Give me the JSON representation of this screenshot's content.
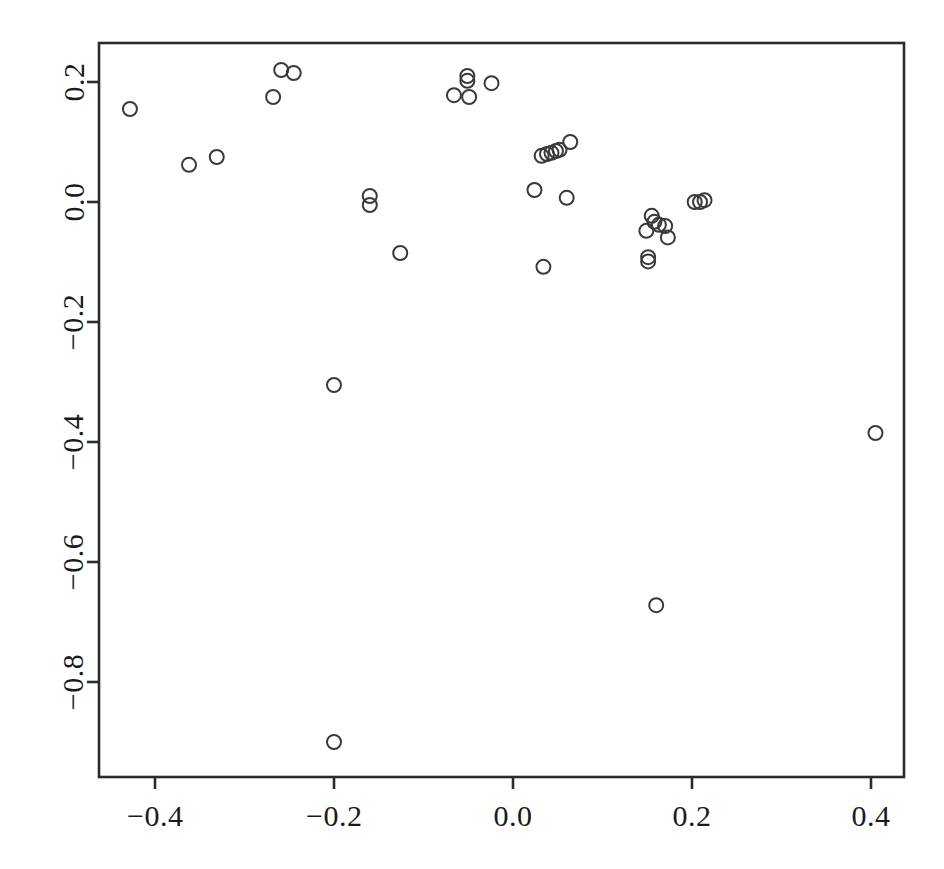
{
  "chart_data": {
    "type": "scatter",
    "title": "",
    "subtitle": "",
    "xlabel": "",
    "ylabel": "",
    "xlim": [
      -0.462,
      0.437
    ],
    "ylim": [
      -0.958,
      0.265
    ],
    "grid": false,
    "legend": null,
    "marker": {
      "shape": "circle-open",
      "radius_px": 7,
      "stroke": "#3a3a3a",
      "stroke_width_px": 2,
      "fill": "none"
    },
    "axes": {
      "x_ticks": [
        -0.4,
        -0.2,
        0.0,
        0.2,
        0.4
      ],
      "x_tick_labels": [
        "-0.4",
        "-0.2",
        "0.0",
        "0.2",
        "0.4"
      ],
      "y_ticks": [
        0.2,
        0.0,
        -0.2,
        -0.4,
        -0.6,
        -0.8
      ],
      "y_tick_labels": [
        "0.2",
        "0.0",
        "-0.2",
        "-0.4",
        "-0.6",
        "-0.8"
      ],
      "box": true,
      "tick_direction": "out"
    },
    "n_points": 37,
    "points": [
      {
        "x": -0.428,
        "y": 0.155
      },
      {
        "x": -0.362,
        "y": 0.062
      },
      {
        "x": -0.331,
        "y": 0.075
      },
      {
        "x": -0.268,
        "y": 0.175
      },
      {
        "x": -0.259,
        "y": 0.22
      },
      {
        "x": -0.245,
        "y": 0.215
      },
      {
        "x": -0.2,
        "y": -0.305
      },
      {
        "x": -0.2,
        "y": -0.9
      },
      {
        "x": -0.16,
        "y": 0.01
      },
      {
        "x": -0.16,
        "y": -0.005
      },
      {
        "x": -0.126,
        "y": -0.085
      },
      {
        "x": -0.066,
        "y": 0.178
      },
      {
        "x": -0.051,
        "y": 0.21
      },
      {
        "x": -0.051,
        "y": 0.202
      },
      {
        "x": -0.049,
        "y": 0.175
      },
      {
        "x": -0.024,
        "y": 0.198
      },
      {
        "x": 0.024,
        "y": 0.02
      },
      {
        "x": 0.032,
        "y": 0.077
      },
      {
        "x": 0.034,
        "y": -0.108
      },
      {
        "x": 0.038,
        "y": 0.08
      },
      {
        "x": 0.043,
        "y": 0.082
      },
      {
        "x": 0.048,
        "y": 0.085
      },
      {
        "x": 0.052,
        "y": 0.087
      },
      {
        "x": 0.06,
        "y": 0.007
      },
      {
        "x": 0.064,
        "y": 0.1
      },
      {
        "x": 0.149,
        "y": -0.048
      },
      {
        "x": 0.151,
        "y": -0.092
      },
      {
        "x": 0.151,
        "y": -0.099
      },
      {
        "x": 0.155,
        "y": -0.023
      },
      {
        "x": 0.158,
        "y": -0.033
      },
      {
        "x": 0.16,
        "y": -0.672
      },
      {
        "x": 0.163,
        "y": -0.038
      },
      {
        "x": 0.17,
        "y": -0.04
      },
      {
        "x": 0.173,
        "y": -0.059
      },
      {
        "x": 0.203,
        "y": 0.0
      },
      {
        "x": 0.209,
        "y": 0.0
      },
      {
        "x": 0.214,
        "y": 0.003
      },
      {
        "x": 0.405,
        "y": -0.385
      }
    ]
  },
  "geometry": {
    "plot_box_px": {
      "left": 99,
      "top": 43,
      "right": 904,
      "bottom": 777
    },
    "x_px_per_unit": 895,
    "x_origin_px": 513,
    "y_px_per_unit": 600,
    "y_origin_px": 202,
    "tick_len_px": 12
  }
}
